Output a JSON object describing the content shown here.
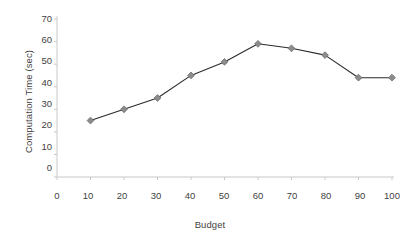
{
  "chart_data": {
    "type": "line",
    "title": "",
    "xlabel": "Budget",
    "ylabel": "Computation Time (sec)",
    "x": [
      10,
      20,
      30,
      40,
      50,
      60,
      70,
      80,
      90,
      100
    ],
    "values": [
      25,
      30,
      35,
      45,
      51,
      59,
      57,
      54,
      44,
      44
    ],
    "series": [
      {
        "name": "Computation Time",
        "values": [
          25,
          30,
          35,
          45,
          51,
          59,
          57,
          54,
          44,
          44
        ]
      }
    ],
    "xlim": [
      0,
      100
    ],
    "ylim": [
      0,
      70
    ],
    "xticks": [
      "0",
      "10",
      "20",
      "30",
      "40",
      "50",
      "60",
      "70",
      "80",
      "90",
      "100"
    ],
    "yticks": [
      "0",
      "10",
      "20",
      "30",
      "40",
      "50",
      "60",
      "70"
    ],
    "grid": false,
    "legend": "none",
    "marker": "diamond",
    "line_color": "#2b2b2b",
    "marker_color": "#8c8c8c",
    "marker_edge_color": "#6e6e6e",
    "axis_color": "#c8c8c8",
    "text_color": "#3f3f3f"
  }
}
